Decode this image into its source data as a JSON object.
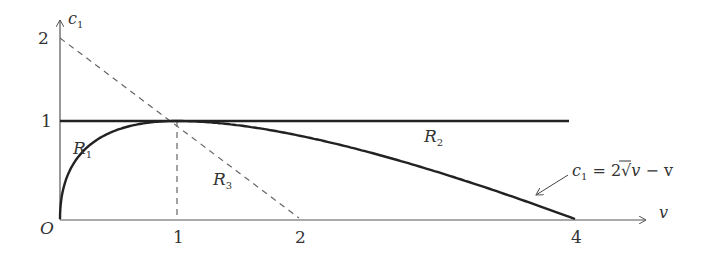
{
  "diagram": {
    "axes": {
      "x_label": "v",
      "y_label": "c",
      "y_label_sub": "1",
      "origin_label": "O",
      "x_ticks": [
        {
          "value": 1,
          "label": "1",
          "px": 177
        },
        {
          "value": 2,
          "label": "2",
          "px": 299
        },
        {
          "value": 4,
          "label": "4",
          "px": 575
        }
      ],
      "y_ticks": [
        {
          "value": 1,
          "label": "1",
          "py": 121
        },
        {
          "value": 2,
          "label": "2",
          "py": 38
        }
      ]
    },
    "regions": [
      {
        "name": "R",
        "sub": "1"
      },
      {
        "name": "R",
        "sub": "2"
      },
      {
        "name": "R",
        "sub": "3"
      }
    ],
    "equation": {
      "lhs": "c",
      "lhs_sub": "1",
      "eq": " = 2",
      "sqrt_arg": "v",
      "rest": " − v"
    },
    "curves": [
      {
        "name": "c1 = 2√v − v",
        "style": "solid-thick",
        "v_range": [
          0,
          4
        ]
      },
      {
        "name": "c1 = 1",
        "style": "solid-thick",
        "v_range": [
          0,
          4.0
        ]
      },
      {
        "name": "c1 = 2 − v",
        "style": "dashed",
        "v_range": [
          0,
          2
        ]
      },
      {
        "name": "v = 1",
        "style": "dashed",
        "v_range": [
          1,
          1
        ]
      }
    ],
    "colors": {
      "line": "#222222",
      "axis": "#555555",
      "dash": "#666666",
      "text": "#333333"
    }
  }
}
